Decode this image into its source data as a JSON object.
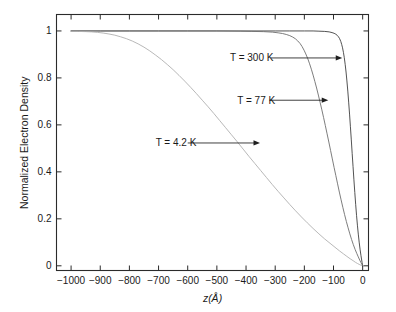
{
  "chart_data": {
    "type": "line",
    "title": "",
    "xlabel": "z(Å)",
    "ylabel": "Normalized Electron Density",
    "xlim": [
      -1050,
      20
    ],
    "ylim": [
      -0.02,
      1.07
    ],
    "grid": false,
    "legend_position": "inline-annotations",
    "xticks": [
      -1000,
      -900,
      -800,
      -700,
      -600,
      -500,
      -400,
      -300,
      -200,
      -100,
      0
    ],
    "xticklabels": [
      "−1000",
      "−900",
      "−800",
      "−700",
      "−600",
      "−500",
      "−400",
      "−300",
      "−200",
      "−100",
      "0"
    ],
    "yticks": [
      0,
      0.2,
      0.4,
      0.6,
      0.8,
      1
    ],
    "yticklabels": [
      "0",
      "0.2",
      "0.4",
      "0.6",
      "0.8",
      "1"
    ],
    "series": [
      {
        "name": "T = 300 K",
        "color": "#3f3f3f",
        "points": [
          [
            -1000,
            1.0
          ],
          [
            -900,
            1.0
          ],
          [
            -800,
            1.0
          ],
          [
            -700,
            1.0
          ],
          [
            -600,
            1.0
          ],
          [
            -500,
            1.0
          ],
          [
            -400,
            1.0
          ],
          [
            -300,
            1.0
          ],
          [
            -250,
            1.0
          ],
          [
            -200,
            1.0
          ],
          [
            -170,
            1.0
          ],
          [
            -150,
            0.999
          ],
          [
            -130,
            0.998
          ],
          [
            -115,
            0.996
          ],
          [
            -105,
            0.993
          ],
          [
            -98,
            0.99
          ],
          [
            -92,
            0.986
          ],
          [
            -87,
            0.981
          ],
          [
            -83,
            0.975
          ],
          [
            -79,
            0.967
          ],
          [
            -75,
            0.955
          ],
          [
            -72,
            0.943
          ],
          [
            -69,
            0.928
          ],
          [
            -66,
            0.909
          ],
          [
            -63,
            0.886
          ],
          [
            -60,
            0.858
          ],
          [
            -57,
            0.825
          ],
          [
            -54,
            0.787
          ],
          [
            -51,
            0.744
          ],
          [
            -48,
            0.697
          ],
          [
            -45,
            0.646
          ],
          [
            -42,
            0.592
          ],
          [
            -39,
            0.536
          ],
          [
            -36,
            0.479
          ],
          [
            -33,
            0.422
          ],
          [
            -30,
            0.366
          ],
          [
            -27,
            0.312
          ],
          [
            -24,
            0.262
          ],
          [
            -21,
            0.215
          ],
          [
            -18,
            0.173
          ],
          [
            -15,
            0.135
          ],
          [
            -12,
            0.101
          ],
          [
            -9,
            0.071
          ],
          [
            -6,
            0.045
          ],
          [
            -4,
            0.029
          ],
          [
            -2,
            0.014
          ],
          [
            0,
            0.0
          ]
        ]
      },
      {
        "name": "T = 77 K",
        "color": "#6e6e6e",
        "points": [
          [
            -1000,
            1.0
          ],
          [
            -900,
            1.0
          ],
          [
            -800,
            1.0
          ],
          [
            -700,
            1.0
          ],
          [
            -600,
            1.0
          ],
          [
            -500,
            1.0
          ],
          [
            -420,
            0.999
          ],
          [
            -380,
            0.998
          ],
          [
            -340,
            0.997
          ],
          [
            -310,
            0.995
          ],
          [
            -290,
            0.992
          ],
          [
            -275,
            0.989
          ],
          [
            -262,
            0.985
          ],
          [
            -250,
            0.98
          ],
          [
            -240,
            0.974
          ],
          [
            -231,
            0.967
          ],
          [
            -223,
            0.958
          ],
          [
            -215,
            0.947
          ],
          [
            -208,
            0.934
          ],
          [
            -201,
            0.918
          ],
          [
            -195,
            0.902
          ],
          [
            -188,
            0.881
          ],
          [
            -182,
            0.86
          ],
          [
            -176,
            0.837
          ],
          [
            -170,
            0.812
          ],
          [
            -164,
            0.785
          ],
          [
            -158,
            0.757
          ],
          [
            -152,
            0.727
          ],
          [
            -146,
            0.696
          ],
          [
            -140,
            0.664
          ],
          [
            -134,
            0.631
          ],
          [
            -128,
            0.597
          ],
          [
            -122,
            0.562
          ],
          [
            -116,
            0.527
          ],
          [
            -110,
            0.491
          ],
          [
            -104,
            0.455
          ],
          [
            -98,
            0.419
          ],
          [
            -92,
            0.384
          ],
          [
            -86,
            0.349
          ],
          [
            -80,
            0.314
          ],
          [
            -74,
            0.281
          ],
          [
            -68,
            0.249
          ],
          [
            -62,
            0.218
          ],
          [
            -56,
            0.189
          ],
          [
            -50,
            0.162
          ],
          [
            -44,
            0.136
          ],
          [
            -38,
            0.112
          ],
          [
            -32,
            0.09
          ],
          [
            -26,
            0.07
          ],
          [
            -20,
            0.052
          ],
          [
            -15,
            0.038
          ],
          [
            -10,
            0.024
          ],
          [
            -6,
            0.014
          ],
          [
            -3,
            0.007
          ],
          [
            0,
            0.0
          ]
        ]
      },
      {
        "name": "T = 4.2 K",
        "color": "#b0b0b0",
        "points": [
          [
            -1000,
            0.998
          ],
          [
            -975,
            0.998
          ],
          [
            -950,
            0.997
          ],
          [
            -930,
            0.996
          ],
          [
            -910,
            0.994
          ],
          [
            -890,
            0.991
          ],
          [
            -870,
            0.987
          ],
          [
            -850,
            0.982
          ],
          [
            -830,
            0.975
          ],
          [
            -810,
            0.967
          ],
          [
            -790,
            0.957
          ],
          [
            -770,
            0.945
          ],
          [
            -750,
            0.931
          ],
          [
            -730,
            0.915
          ],
          [
            -710,
            0.897
          ],
          [
            -690,
            0.878
          ],
          [
            -670,
            0.857
          ],
          [
            -650,
            0.835
          ],
          [
            -630,
            0.811
          ],
          [
            -610,
            0.786
          ],
          [
            -590,
            0.76
          ],
          [
            -570,
            0.733
          ],
          [
            -550,
            0.705
          ],
          [
            -530,
            0.677
          ],
          [
            -510,
            0.648
          ],
          [
            -490,
            0.618
          ],
          [
            -470,
            0.588
          ],
          [
            -450,
            0.558
          ],
          [
            -430,
            0.528
          ],
          [
            -410,
            0.497
          ],
          [
            -390,
            0.466
          ],
          [
            -370,
            0.436
          ],
          [
            -350,
            0.406
          ],
          [
            -330,
            0.376
          ],
          [
            -310,
            0.346
          ],
          [
            -290,
            0.317
          ],
          [
            -270,
            0.289
          ],
          [
            -250,
            0.261
          ],
          [
            -230,
            0.234
          ],
          [
            -210,
            0.208
          ],
          [
            -190,
            0.183
          ],
          [
            -170,
            0.159
          ],
          [
            -150,
            0.136
          ],
          [
            -130,
            0.114
          ],
          [
            -112,
            0.096
          ],
          [
            -95,
            0.079
          ],
          [
            -80,
            0.064
          ],
          [
            -66,
            0.051
          ],
          [
            -54,
            0.04
          ],
          [
            -43,
            0.03
          ],
          [
            -33,
            0.022
          ],
          [
            -25,
            0.015
          ],
          [
            -18,
            0.01
          ],
          [
            -12,
            0.006
          ],
          [
            -7,
            0.003
          ],
          [
            -3,
            0.001
          ],
          [
            0,
            0.0
          ]
        ]
      }
    ],
    "annotations": [
      {
        "label": "T = 300 K",
        "text_x": -455,
        "text_y": 0.885,
        "arrow_from_x": -315,
        "arrow_to_x": -70,
        "arrow_y": 0.885
      },
      {
        "label": "T = 77 K",
        "text_x": -430,
        "text_y": 0.705,
        "arrow_from_x": -320,
        "arrow_to_x": -118,
        "arrow_y": 0.705
      },
      {
        "label": "T = 4.2 K",
        "text_x": -710,
        "text_y": 0.523,
        "arrow_from_x": -600,
        "arrow_to_x": -352,
        "arrow_y": 0.523
      }
    ]
  }
}
